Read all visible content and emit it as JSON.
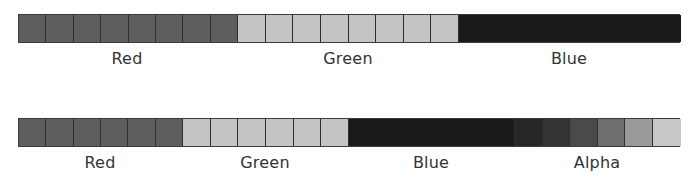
{
  "diagrams": [
    {
      "name": "rgb-layout",
      "top": 14,
      "width": 662,
      "label_top": 49,
      "segments": [
        {
          "label": "Red",
          "cells": 8,
          "width": 219,
          "color": "#5e5e5e",
          "divided": true,
          "label_x": 127
        },
        {
          "label": "Green",
          "cells": 8,
          "width": 221,
          "color": "#c4c4c4",
          "divided": true,
          "label_x": 348
        },
        {
          "label": "Blue",
          "cells": 8,
          "width": 222,
          "color": "#1a1a1a",
          "divided": false,
          "label_x": 569
        }
      ]
    },
    {
      "name": "rgba-layout",
      "top": 118,
      "width": 662,
      "label_top": 153,
      "segments": [
        {
          "label": "Red",
          "cells": 6,
          "width": 164,
          "color": "#5e5e5e",
          "divided": true,
          "label_x": 100
        },
        {
          "label": "Green",
          "cells": 6,
          "width": 166,
          "color": "#c4c4c4",
          "divided": true,
          "label_x": 265
        },
        {
          "label": "Blue",
          "cells": 6,
          "width": 166,
          "color": "#1a1a1a",
          "divided": false,
          "label_x": 431
        },
        {
          "label": "Alpha",
          "cells": 6,
          "width": 166,
          "colors": [
            "#262626",
            "#333333",
            "#4a4a4a",
            "#6e6e6e",
            "#9a9a9a",
            "#c8c8c8"
          ],
          "divided": true,
          "label_x": 597
        }
      ]
    }
  ],
  "labels": {
    "top_red": "Red",
    "top_green": "Green",
    "top_blue": "Blue",
    "bottom_red": "Red",
    "bottom_green": "Green",
    "bottom_blue": "Blue",
    "bottom_alpha": "Alpha"
  }
}
